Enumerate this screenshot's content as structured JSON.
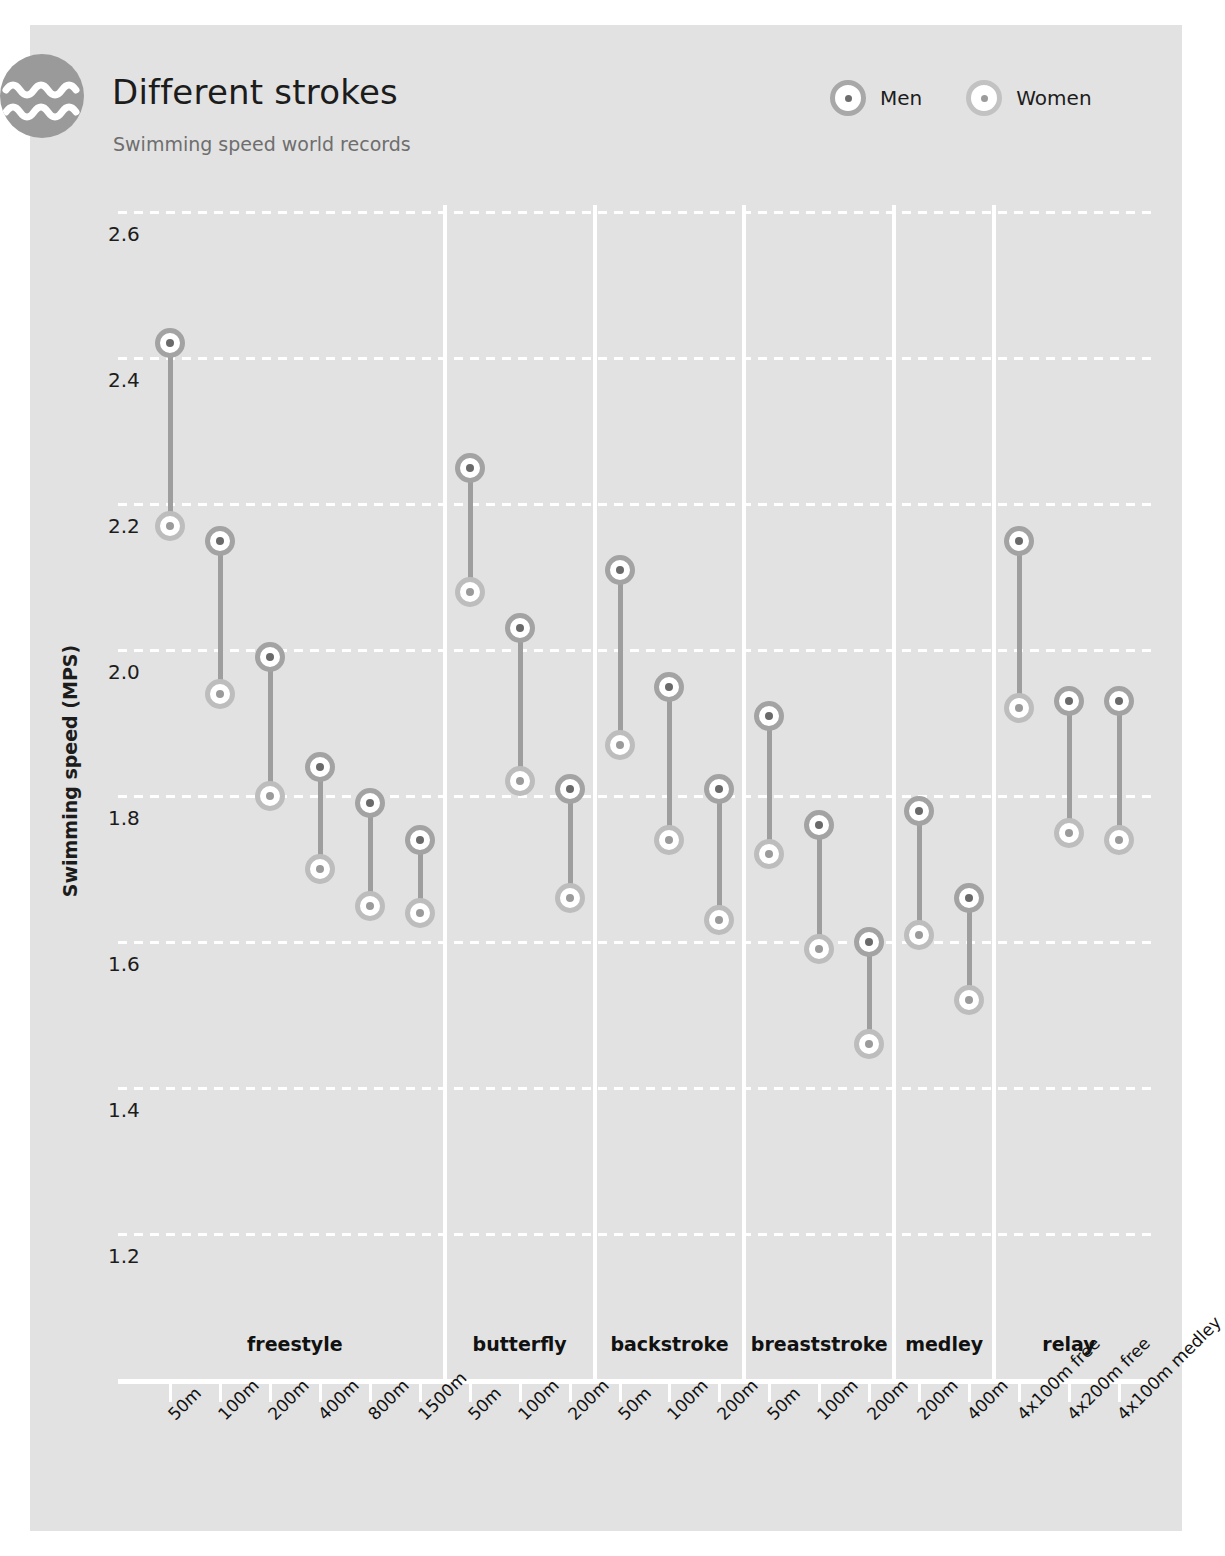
{
  "header": {
    "title": "Different strokes",
    "subtitle": "Swimming speed world records",
    "icon": "waves-icon"
  },
  "legend": {
    "position": "top-right",
    "items": [
      {
        "label": "Men",
        "marker": "men-marker",
        "ring": "#a3a3a3",
        "dot": "#6a6a6a"
      },
      {
        "label": "Women",
        "marker": "women-marker",
        "ring": "#bdbdbd",
        "dot": "#9b9b9b"
      }
    ]
  },
  "colors": {
    "panel_background": "#e2e2e2",
    "page_background": "#ffffff",
    "gridline": "#ffffff",
    "connector": "#9e9e9e",
    "badge": "#9a9a9a",
    "title_text": "#1c1c1c",
    "subtitle_text": "#6e6e6e"
  },
  "chart_data": {
    "type": "scatter",
    "title": "Different strokes",
    "subtitle": "Swimming speed world records",
    "xlabel": "",
    "ylabel": "Swimming speed (MPS)",
    "ylim": [
      1.15,
      2.65
    ],
    "yticks": [
      "2.6",
      "2.4",
      "2.2",
      "2.0",
      "1.8",
      "1.6",
      "1.4",
      "1.2"
    ],
    "ytick_values": [
      2.6,
      2.4,
      2.2,
      2.0,
      1.8,
      1.6,
      1.4,
      1.2
    ],
    "grid": true,
    "grid_style": "dotted-horizontal",
    "legend_position": "top-right",
    "groups": [
      {
        "name": "freestyle",
        "count": 6
      },
      {
        "name": "butterfly",
        "count": 3
      },
      {
        "name": "backstroke",
        "count": 3
      },
      {
        "name": "breaststroke",
        "count": 3
      },
      {
        "name": "medley",
        "count": 2
      },
      {
        "name": "relay",
        "count": 3
      }
    ],
    "categories": [
      "50m",
      "100m",
      "200m",
      "400m",
      "800m",
      "1500m",
      "50m",
      "100m",
      "200m",
      "50m",
      "100m",
      "200m",
      "50m",
      "100m",
      "200m",
      "200m",
      "400m",
      "4x100m free",
      "4x200m free",
      "4x100m medley"
    ],
    "series": [
      {
        "name": "Men",
        "values": [
          2.42,
          2.15,
          1.99,
          1.84,
          1.79,
          1.74,
          2.25,
          2.03,
          1.81,
          2.11,
          1.95,
          1.81,
          1.91,
          1.76,
          1.6,
          1.78,
          1.66,
          2.15,
          1.93,
          1.93
        ]
      },
      {
        "name": "Women",
        "values": [
          2.17,
          1.94,
          1.8,
          1.7,
          1.65,
          1.64,
          2.08,
          1.82,
          1.66,
          1.87,
          1.74,
          1.63,
          1.72,
          1.59,
          1.46,
          1.61,
          1.52,
          1.92,
          1.75,
          1.74
        ]
      }
    ]
  }
}
